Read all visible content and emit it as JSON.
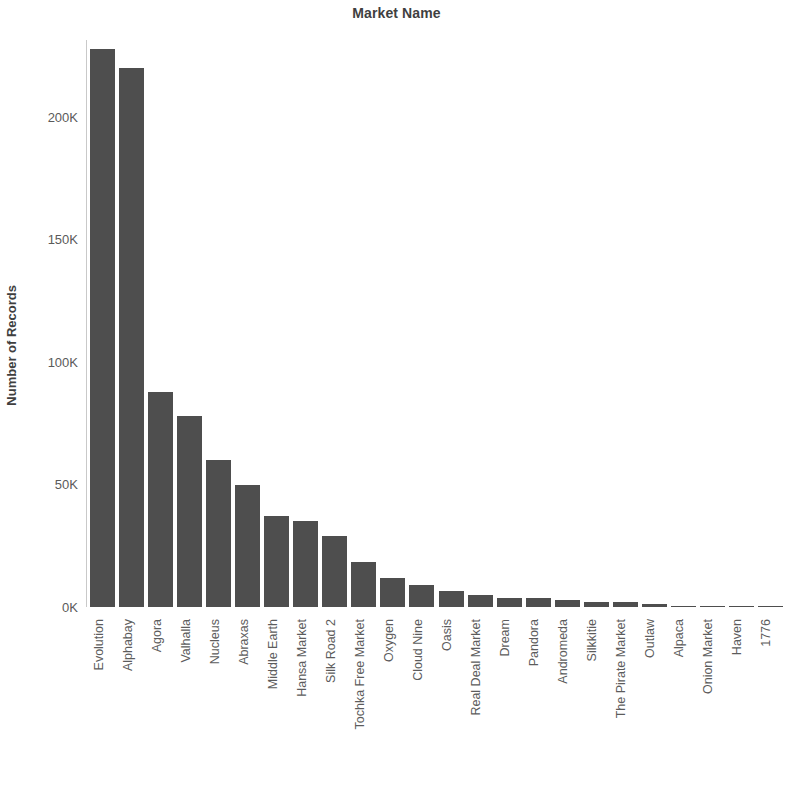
{
  "chart_data": {
    "type": "bar",
    "title": "Market Name",
    "xlabel": "",
    "ylabel": "Number of Records",
    "ylim": [
      0,
      230000
    ],
    "grid": false,
    "legend": null,
    "bar_color": "#4e4e4e",
    "axis_color": "#8c8c8c",
    "text_color": "#5a5a5a",
    "y_ticks": [
      {
        "value": 0,
        "label": "0K"
      },
      {
        "value": 50000,
        "label": "50K"
      },
      {
        "value": 100000,
        "label": "100K"
      },
      {
        "value": 150000,
        "label": "150K"
      },
      {
        "value": 200000,
        "label": "200K"
      }
    ],
    "categories": [
      "Evolution",
      "Alphabay",
      "Agora",
      "Valhalla",
      "Nucleus",
      "Abraxas",
      "Middle Earth",
      "Hansa Market",
      "Silk Road 2",
      "Tochka Free Market",
      "Oxygen",
      "Cloud Nine",
      "Oasis",
      "Real Deal Market",
      "Dream",
      "Pandora",
      "Andromeda",
      "Silkkitie",
      "The Pirate Market",
      "Outlaw",
      "Alpaca",
      "Onion Market",
      "Haven",
      "1776"
    ],
    "values": [
      228000,
      220000,
      88000,
      78000,
      60000,
      50000,
      37000,
      35000,
      29000,
      18500,
      12000,
      9000,
      6500,
      5000,
      3800,
      3600,
      3000,
      2200,
      2000,
      1200,
      500,
      400,
      300,
      200
    ]
  }
}
